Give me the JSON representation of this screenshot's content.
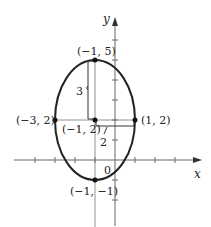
{
  "diagram": {
    "type": "ellipse-graph",
    "axes": {
      "x_label": "x",
      "y_label": "y",
      "origin_label": "0"
    },
    "ellipse": {
      "center": [
        -1,
        2
      ],
      "semi_major_vertical": 3,
      "semi_minor_horizontal": 2
    },
    "points": {
      "top": "(−1, 5)",
      "center": "(−1, 2)",
      "left": "(−3, 2)",
      "right": "(1, 2)",
      "bottom": "(−1, −1)"
    },
    "measurements": {
      "vertical_length": "3",
      "horizontal_length": "2"
    },
    "colors": {
      "curve": "#222222",
      "axis": "#555555"
    }
  }
}
